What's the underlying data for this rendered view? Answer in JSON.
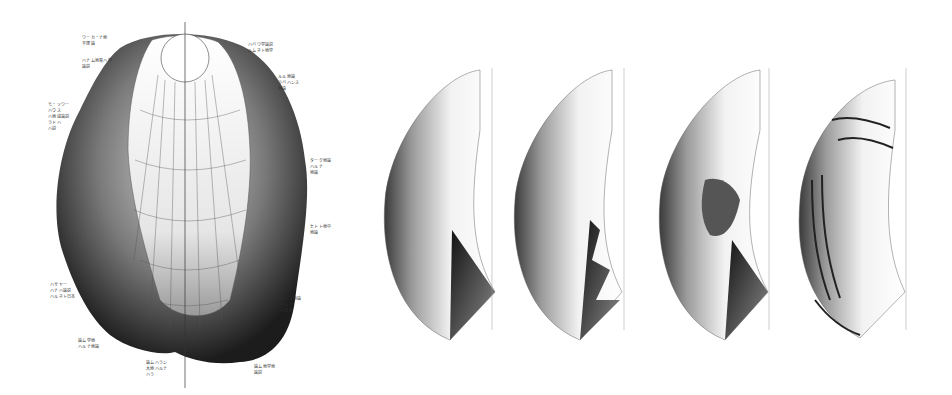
{
  "figure": {
    "main_globe": {
      "description": "Relief globe view centered on north pole, terrain surrounding a lighter gridded cap",
      "axis": {
        "x": 185,
        "top": 22,
        "bottom": 388
      },
      "callouts": [
        {
          "id": "c1",
          "text": "ワーカ・ナ地\n平理論",
          "x": 82,
          "y": 35
        },
        {
          "id": "c2",
          "text": "ハナム地質ハ学\n論説",
          "x": 82,
          "y": 58
        },
        {
          "id": "c3",
          "text": "モ・ソワー\nハウス\nハ地域論説\nラドハ\nハ説",
          "x": 48,
          "y": 102
        },
        {
          "id": "c4",
          "text": "ハバワ学論説\nルムネト地学",
          "x": 248,
          "y": 42
        },
        {
          "id": "c5",
          "text": "ルル地論\nラバハンス\n地論",
          "x": 278,
          "y": 74
        },
        {
          "id": "c6",
          "text": "ターク地論\nハルナ\n地論",
          "x": 310,
          "y": 158
        },
        {
          "id": "c7",
          "text": "ヒトト地中\n地論",
          "x": 310,
          "y": 224
        },
        {
          "id": "c8",
          "text": "ハサヤー\nハナハ論説\nハルネト日本",
          "x": 50,
          "y": 282
        },
        {
          "id": "c9",
          "text": "ワリス地論\nハルナ\nト日本",
          "x": 280,
          "y": 296
        },
        {
          "id": "c10",
          "text": "論ム学地\nハルナ地論",
          "x": 78,
          "y": 338
        },
        {
          "id": "c11",
          "text": "論ムハラン\n大地ハルナ\nハラ",
          "x": 146,
          "y": 360
        },
        {
          "id": "c12",
          "text": "論ム地学地\n論説",
          "x": 254,
          "y": 364
        }
      ]
    },
    "sequence": [
      {
        "id": "stage-1",
        "state": "smooth hemisphere shell with graticule",
        "axis_x": 492
      },
      {
        "id": "stage-2",
        "state": "shell with layered folds on inner edge",
        "axis_x": 624
      },
      {
        "id": "stage-3",
        "state": "shell with eroded interior region",
        "axis_x": 769
      },
      {
        "id": "stage-4",
        "state": "banded striated relief surface",
        "axis_x": 906
      }
    ]
  }
}
